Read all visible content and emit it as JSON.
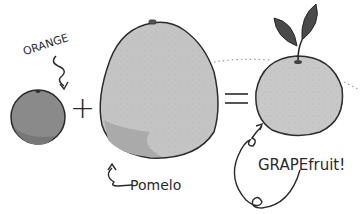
{
  "illustration": {
    "equation": {
      "plus_sign": "+",
      "equals_sign": "=",
      "exclamation": "!"
    },
    "fruits": [
      {
        "label": "ORANGE",
        "role": "input",
        "color": "#8a8a8a"
      },
      {
        "label": "Pomelo",
        "role": "input",
        "color": "#c4c4c4"
      },
      {
        "label": "GRAPEfruit!",
        "role": "result",
        "color": "#c8c8c8"
      }
    ],
    "colors": {
      "ink": "#2a2a2a",
      "background": "#ffffff",
      "leaf": "#4a4a4a"
    }
  }
}
